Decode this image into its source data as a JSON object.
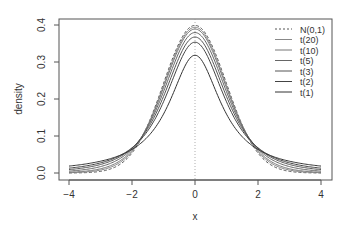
{
  "chart_data": {
    "type": "line",
    "title": "",
    "xlabel": "x",
    "ylabel": "density",
    "xlim": [
      -4,
      4
    ],
    "ylim": [
      0,
      0.4
    ],
    "x_ticks": [
      -4,
      -2,
      0,
      2,
      4
    ],
    "x_tick_labels": [
      "−4",
      "−2",
      "0",
      "2",
      "4"
    ],
    "y_ticks": [
      0.0,
      0.1,
      0.2,
      0.3,
      0.4
    ],
    "y_tick_labels": [
      "0.0",
      "0.1",
      "0.2",
      "0.3",
      "0.4"
    ],
    "grid": false,
    "legend_position": "top-right",
    "annotations": [
      {
        "type": "vertical-dotted-line",
        "x": 0
      }
    ],
    "series": [
      {
        "name": "N(0,1)",
        "dist": "normal",
        "df": null,
        "style": "dashed",
        "color": "#555555",
        "peak": 0.399
      },
      {
        "name": "t(20)",
        "dist": "t",
        "df": 20,
        "style": "solid",
        "color": "#888888",
        "peak": 0.394
      },
      {
        "name": "t(10)",
        "dist": "t",
        "df": 10,
        "style": "solid",
        "color": "#777777",
        "peak": 0.389
      },
      {
        "name": "t(5)",
        "dist": "t",
        "df": 5,
        "style": "solid",
        "color": "#666666",
        "peak": 0.38
      },
      {
        "name": "t(3)",
        "dist": "t",
        "df": 3,
        "style": "solid",
        "color": "#555555",
        "peak": 0.368
      },
      {
        "name": "t(2)",
        "dist": "t",
        "df": 2,
        "style": "solid",
        "color": "#444444",
        "peak": 0.354
      },
      {
        "name": "t(1)",
        "dist": "t",
        "df": 1,
        "style": "solid",
        "color": "#333333",
        "peak": 0.318
      }
    ]
  },
  "legend": {
    "items": [
      "N(0,1)",
      "t(20)",
      "t(10)",
      "t(5)",
      "t(3)",
      "t(2)",
      "t(1)"
    ]
  },
  "axes": {
    "xlabel": "x",
    "ylabel": "density"
  }
}
